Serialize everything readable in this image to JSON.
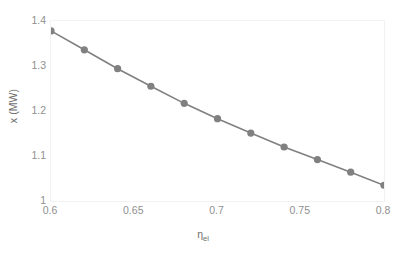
{
  "chart_data": {
    "type": "line",
    "title": "",
    "xlabel": "ηel",
    "xlabel_base": "η",
    "xlabel_sub": "el",
    "ylabel": "x (MW)",
    "xlim": [
      0.6,
      0.8
    ],
    "ylim": [
      1.0,
      1.4
    ],
    "xticks": [
      0.6,
      0.65,
      0.7,
      0.75,
      0.8
    ],
    "xtick_labels": [
      "0.6",
      "0.65",
      "0.7",
      "0.75",
      "0.8"
    ],
    "yticks": [
      1.0,
      1.1,
      1.2,
      1.3,
      1.4
    ],
    "ytick_labels": [
      "1",
      "1.1",
      "1.2",
      "1.3",
      "1.4"
    ],
    "grid": false,
    "legend": false,
    "marker": "circle",
    "series": [
      {
        "name": "x (MW)",
        "color": "#808080",
        "x": [
          0.6,
          0.62,
          0.64,
          0.66,
          0.68,
          0.7,
          0.72,
          0.74,
          0.76,
          0.78,
          0.8
        ],
        "values": [
          1.378,
          1.336,
          1.294,
          1.255,
          1.217,
          1.183,
          1.151,
          1.12,
          1.092,
          1.064,
          1.035
        ]
      }
    ]
  },
  "style": {
    "marker_color": "#808080",
    "line_color": "#808080",
    "border_color": "#f2f2f2",
    "tick_text_color": "#8f8f8f",
    "axis_title_color": "#6d6d6d",
    "background": "#ffffff",
    "marker_radius": 3.6,
    "line_width": 1.6
  }
}
